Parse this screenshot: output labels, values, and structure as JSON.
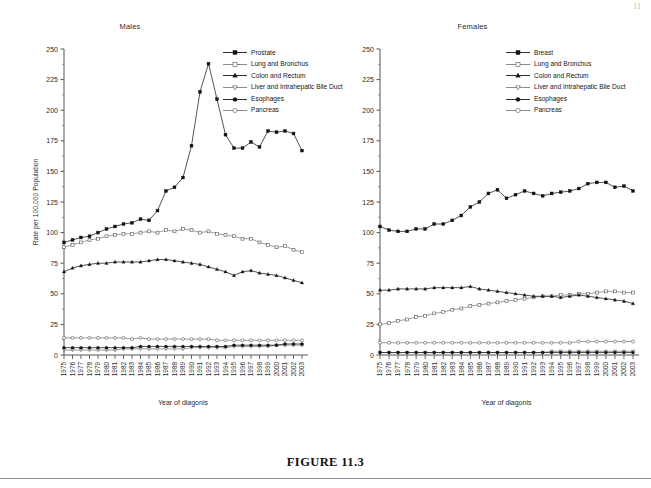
{
  "page": {
    "number": "11"
  },
  "figure": {
    "caption": "FIGURE 11.3"
  },
  "chart_data": [
    {
      "type": "line",
      "title": "Males",
      "xlabel": "Year of diagonis",
      "ylabel": "Rate per 100,000 Population",
      "ylim": [
        0,
        250
      ],
      "yticks": [
        0,
        25,
        50,
        75,
        100,
        125,
        150,
        175,
        200,
        225,
        250
      ],
      "grid": false,
      "legend_position": "top-right",
      "x": [
        1975,
        1976,
        1977,
        1978,
        1979,
        1980,
        1981,
        1982,
        1983,
        1984,
        1985,
        1986,
        1987,
        1988,
        1989,
        1990,
        1991,
        1992,
        1993,
        1994,
        1995,
        1996,
        1997,
        1998,
        1999,
        2000,
        2001,
        2002,
        2003
      ],
      "series": [
        {
          "name": "Prostate",
          "marker": "filled-square",
          "values": [
            92,
            94,
            96,
            97,
            100,
            103,
            105,
            107,
            108,
            111,
            110,
            118,
            134,
            137,
            145,
            171,
            215,
            238,
            209,
            180,
            169,
            169,
            174,
            170,
            183,
            182,
            183,
            181,
            167,
            160
          ]
        },
        {
          "name": "Lung and Bronchus",
          "marker": "open-square",
          "values": [
            88,
            90,
            92,
            94,
            95,
            97,
            98,
            99,
            99,
            100,
            101,
            100,
            102,
            101,
            103,
            102,
            100,
            101,
            99,
            98,
            97,
            95,
            95,
            92,
            90,
            88,
            89,
            86,
            84,
            80,
            78,
            75
          ]
        },
        {
          "name": "Colon and Rectum",
          "marker": "filled-triangle",
          "values": [
            68,
            71,
            73,
            74,
            75,
            75,
            76,
            76,
            76,
            76,
            77,
            78,
            78,
            77,
            76,
            75,
            74,
            72,
            70,
            68,
            65,
            68,
            69,
            67,
            66,
            65,
            63,
            61,
            59,
            57
          ]
        },
        {
          "name": "Liver and Intrahepatic Bile Duct",
          "marker": "open-triangle-down",
          "values": [
            4,
            4,
            4,
            4,
            4,
            4,
            4,
            5,
            5,
            5,
            5,
            5,
            5,
            5,
            5,
            6,
            6,
            6,
            6,
            6,
            7,
            7,
            7,
            7,
            7,
            8,
            8,
            8,
            8
          ]
        },
        {
          "name": "Esophages",
          "marker": "filled-circle",
          "values": [
            6,
            6,
            6,
            6,
            6,
            6,
            6,
            6,
            6,
            7,
            7,
            7,
            7,
            7,
            7,
            7,
            7,
            7,
            7,
            7,
            8,
            8,
            8,
            8,
            8,
            8,
            9,
            9,
            9
          ]
        },
        {
          "name": "Pancreas",
          "marker": "open-circle",
          "values": [
            14,
            14,
            14,
            14,
            14,
            14,
            14,
            14,
            13,
            14,
            13,
            13,
            13,
            13,
            13,
            13,
            13,
            13,
            12,
            12,
            12,
            12,
            12,
            12,
            12,
            12,
            12,
            12,
            12
          ]
        }
      ]
    },
    {
      "type": "line",
      "title": "Females",
      "xlabel": "Year of diagonis",
      "ylabel": "",
      "ylim": [
        0,
        250
      ],
      "yticks": [
        0,
        25,
        50,
        75,
        100,
        125,
        150,
        175,
        200,
        225,
        250
      ],
      "grid": false,
      "legend_position": "top-right",
      "x": [
        1975,
        1976,
        1977,
        1978,
        1979,
        1980,
        1981,
        1982,
        1983,
        1984,
        1985,
        1986,
        1987,
        1988,
        1989,
        1990,
        1991,
        1992,
        1993,
        1994,
        1995,
        1996,
        1997,
        1998,
        1999,
        2000,
        2001,
        2002,
        2003
      ],
      "series": [
        {
          "name": "Breast",
          "marker": "filled-square",
          "values": [
            105,
            102,
            101,
            101,
            103,
            103,
            107,
            107,
            110,
            114,
            121,
            125,
            132,
            135,
            128,
            131,
            134,
            132,
            130,
            132,
            133,
            134,
            136,
            140,
            141,
            141,
            137,
            138,
            134,
            125,
            125
          ]
        },
        {
          "name": "Lung and Bronchus",
          "marker": "open-square",
          "values": [
            25,
            26,
            28,
            29,
            31,
            32,
            34,
            35,
            37,
            38,
            40,
            41,
            42,
            43,
            44,
            45,
            46,
            47,
            48,
            48,
            49,
            49,
            50,
            50,
            51,
            52,
            52,
            51,
            51
          ]
        },
        {
          "name": "Colon and Rectum",
          "marker": "filled-triangle",
          "values": [
            53,
            53,
            54,
            54,
            54,
            54,
            55,
            55,
            55,
            55,
            56,
            54,
            53,
            52,
            51,
            50,
            49,
            48,
            48,
            48,
            47,
            48,
            49,
            48,
            47,
            46,
            45,
            44,
            42
          ]
        },
        {
          "name": "Liver and Intrahepatic Bile Duct",
          "marker": "open-triangle-down",
          "values": [
            2,
            2,
            2,
            2,
            2,
            2,
            2,
            2,
            2,
            2,
            2,
            2,
            2,
            2,
            2,
            2,
            2,
            2,
            2,
            3,
            3,
            3,
            3,
            3,
            3,
            3,
            3,
            3,
            3
          ]
        },
        {
          "name": "Esophages",
          "marker": "filled-circle",
          "values": [
            2,
            2,
            2,
            2,
            2,
            2,
            2,
            2,
            2,
            2,
            2,
            2,
            2,
            2,
            2,
            2,
            2,
            2,
            2,
            2,
            2,
            2,
            2,
            2,
            2,
            2,
            2,
            2,
            2
          ]
        },
        {
          "name": "Pancreas",
          "marker": "open-circle",
          "values": [
            10,
            10,
            10,
            10,
            10,
            10,
            10,
            10,
            10,
            10,
            10,
            10,
            10,
            10,
            10,
            10,
            10,
            10,
            10,
            10,
            10,
            10,
            11,
            11,
            11,
            11,
            11,
            11,
            11
          ]
        }
      ]
    }
  ]
}
